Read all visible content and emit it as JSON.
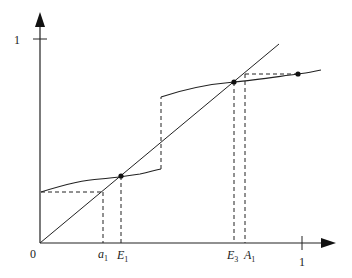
{
  "diagram": {
    "type": "step-function-fixed-points",
    "axes": {
      "origin_label": "0",
      "x_tick_label": "1",
      "y_tick_label": "1"
    },
    "labels": {
      "a1": {
        "base": "a",
        "sub": "1"
      },
      "E1": {
        "base": "E",
        "sub": "1"
      },
      "E3": {
        "base": "E",
        "sub": "3"
      },
      "A1": {
        "base": "A",
        "sub": "1"
      }
    },
    "colors": {
      "stroke": "#222222",
      "background": "#ffffff"
    }
  }
}
